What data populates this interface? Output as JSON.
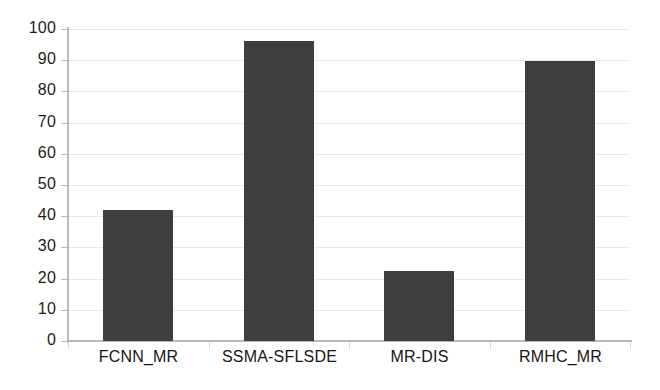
{
  "chart_data": {
    "type": "bar",
    "title": "",
    "subtitle": "",
    "xlabel": "",
    "ylabel": "",
    "categories": [
      "FCNN_MR",
      "SSMA-SFLSDE",
      "MR-DIS",
      "RMHC_MR"
    ],
    "values": [
      42,
      96,
      22.5,
      89.8
    ],
    "series": [
      {
        "name": "",
        "values": [
          42,
          96,
          22.5,
          89.8
        ]
      }
    ],
    "ylim": [
      0,
      100
    ],
    "ytick_labels": [
      "0",
      "10",
      "20",
      "30",
      "40",
      "50",
      "60",
      "70",
      "80",
      "90",
      "100"
    ],
    "ytick_values": [
      0,
      10,
      20,
      30,
      40,
      50,
      60,
      70,
      80,
      90,
      100
    ],
    "grid": true,
    "grid_axis": "y",
    "legend": false,
    "legend_position": "none",
    "annotations": [],
    "colors": {
      "bar": "#3e3e3e",
      "gridline": "#e9e9e9",
      "axis": "#b9b9b9",
      "tick_text": "#1d1d1d",
      "category_text": "#161616",
      "background": "#ffffff"
    }
  }
}
